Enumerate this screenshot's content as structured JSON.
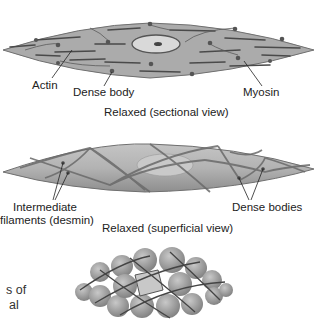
{
  "panels": [
    {
      "id": "sectional",
      "caption": "Relaxed (sectional view)",
      "labels": {
        "actin": "Actin",
        "dense_body": "Dense body",
        "myosin": "Myosin"
      }
    },
    {
      "id": "superficial",
      "caption": "Relaxed (superficial view)",
      "labels": {
        "intermediate_line1": "Intermediate",
        "intermediate_line2": "filaments (desmin)",
        "dense_bodies": "Dense bodies"
      }
    },
    {
      "id": "contracted",
      "cutoff_text_line1": "s of",
      "cutoff_text_line2": "al"
    }
  ],
  "colors": {
    "cell_fill": "#a9a9a9",
    "cell_edge": "#6e6e6e",
    "filament": "#4a4a4a",
    "dense_body": "#555555",
    "nucleus": "#d6d6d6",
    "contracted_fill": "#9a9a9a"
  }
}
